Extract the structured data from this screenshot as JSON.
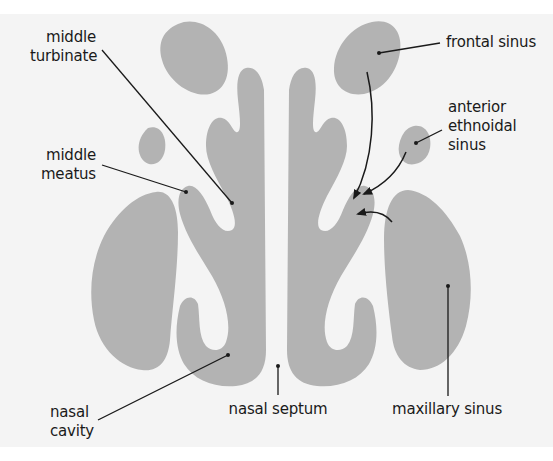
{
  "diagram": {
    "title": "",
    "colors": {
      "background": "#f4f4f4",
      "structure_fill": "#b3b3b3",
      "line": "#1a1a1a",
      "text": "#1a1a1a"
    },
    "labels": {
      "middle_turbinate": "middle\nturbinate",
      "middle_meatus": "middle\nmeatus",
      "frontal_sinus": "frontal sinus",
      "anterior_ethmoidal_sinus": "anterior\nethnoidal\nsinus",
      "nasal_cavity": "nasal\ncavity",
      "nasal_septum": "nasal septum",
      "maxillary_sinus": "maxillary sinus"
    },
    "arrows": [
      {
        "from": "frontal sinus",
        "to": "middle meatus"
      },
      {
        "from": "anterior ethnoidal sinus",
        "to": "middle meatus"
      },
      {
        "from": "maxillary sinus",
        "to": "middle meatus"
      }
    ]
  }
}
